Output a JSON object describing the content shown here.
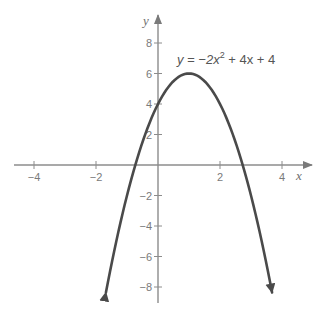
{
  "chart_data": {
    "type": "line",
    "title": "",
    "function": "y = -2x^2 + 4x + 4",
    "annotation": {
      "prefix": "y = −2x",
      "exponent": "2",
      "suffix": " + 4x + 4"
    },
    "xlabel": "x",
    "ylabel": "y",
    "xlim": [
      -4.5,
      4.5
    ],
    "ylim": [
      -9,
      9
    ],
    "x_ticks": [
      -4,
      -2,
      2,
      4
    ],
    "x_tick_labels": [
      "−4",
      "−2",
      "2",
      "4"
    ],
    "y_ticks": [
      8,
      6,
      4,
      2,
      -2,
      -4,
      -6,
      -8
    ],
    "y_tick_labels": [
      "8",
      "6",
      "4",
      "2",
      "−2",
      "−4",
      "−6",
      "−8"
    ],
    "grid": false,
    "legend": null,
    "series": [
      {
        "name": "y = -2x^2 + 4x + 4",
        "vertex": [
          1,
          6
        ],
        "y_intercept": [
          0,
          4
        ],
        "x_intercepts": [
          -0.732,
          2.732
        ],
        "x": [
          -1.7,
          -1.5,
          -1,
          -0.5,
          0,
          0.5,
          1,
          1.5,
          2,
          2.5,
          3,
          3.5,
          3.7
        ],
        "values": [
          -8.58,
          -6.5,
          -2,
          1.5,
          4,
          5.5,
          6,
          5.5,
          4,
          1.5,
          -2,
          -6.5,
          -8.58
        ]
      }
    ],
    "colors": {
      "curve": "#4a4a4a",
      "axes": "#8c8c8c",
      "text": "#707070"
    }
  }
}
